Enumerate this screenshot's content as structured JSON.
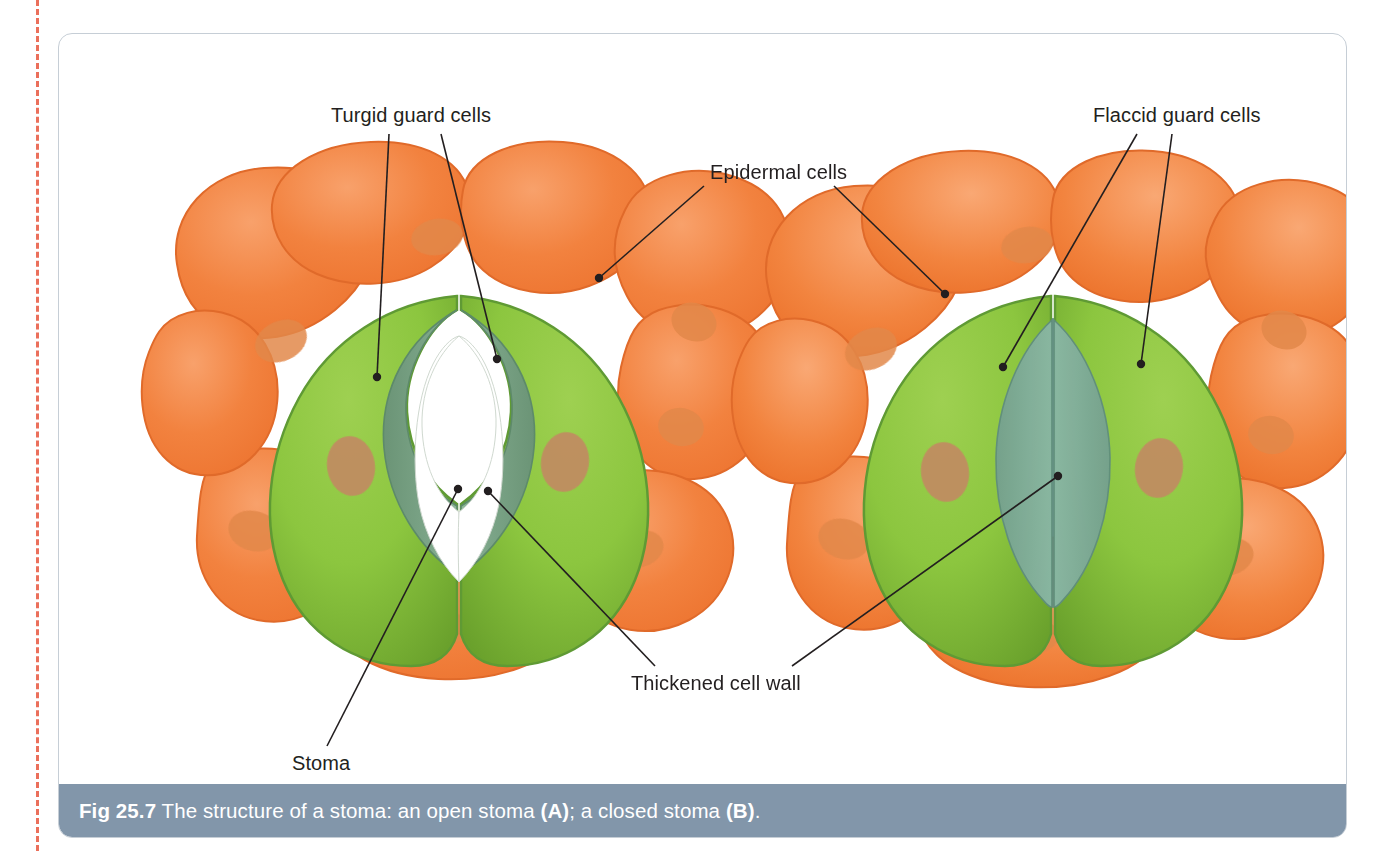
{
  "figure": {
    "caption_prefix": "Fig 25.7",
    "caption_body": " The structure of a stoma: an open stoma ",
    "caption_a": "(A)",
    "caption_mid": "; a closed stoma ",
    "caption_b": "(B)",
    "caption_end": ".",
    "caption_full": "Fig 25.7 The structure of a stoma: an open stoma (A); a closed stoma (B)."
  },
  "labels": {
    "turgid_guard_cells": "Turgid guard cells",
    "epidermal_cells": "Epidermal cells",
    "flaccid_guard_cells": "Flaccid guard cells",
    "thickened_cell_wall": "Thickened cell wall",
    "stoma": "Stoma"
  },
  "diagrams": [
    {
      "id": "A",
      "name": "open-stoma",
      "state": "open",
      "guard_cell_state": "turgid",
      "pore_visible": true,
      "epidermal_cell_count": 8,
      "guard_cell_count": 2
    },
    {
      "id": "B",
      "name": "closed-stoma",
      "state": "closed",
      "guard_cell_state": "flaccid",
      "pore_visible": false,
      "epidermal_cell_count": 8,
      "guard_cell_count": 2
    }
  ],
  "colors": {
    "epidermal_fill": "#f2823f",
    "epidermal_fill_light": "#f59a5e",
    "epidermal_stroke": "#e06a2a",
    "epidermal_nucleus": "#e08a4a",
    "guard_cell_fill": "#8cc63f",
    "guard_cell_fill_dark": "#6fa72f",
    "guard_cell_stroke": "#5f9a34",
    "guard_nucleus": "#c28a62",
    "thickened_wall_open": "#6e9a78",
    "thickened_wall_closed": "#79a596",
    "pore_white": "#ffffff",
    "caption_bar": "#8296aa",
    "caption_text": "#ffffff",
    "label_text": "#231f20",
    "leader_line": "#231f20",
    "box_border": "#c6ced6",
    "trim_line": "#e8573f"
  },
  "leaders": {
    "turgid_left": {
      "from": [
        330,
        100
      ],
      "to": [
        318,
        343
      ]
    },
    "turgid_right": {
      "from": [
        382,
        100
      ],
      "to": [
        438,
        325
      ]
    },
    "epidermal_left": {
      "from": [
        645,
        152
      ],
      "to": [
        540,
        244
      ]
    },
    "epidermal_right": {
      "from": [
        775,
        152
      ],
      "to": [
        886,
        260
      ]
    },
    "flaccid_left": {
      "from": [
        1078,
        100
      ],
      "to": [
        944,
        333
      ]
    },
    "flaccid_right": {
      "from": [
        1113,
        100
      ],
      "to": [
        1082,
        330
      ]
    },
    "thickened_left": {
      "from": [
        596,
        632
      ],
      "to": [
        429,
        457
      ]
    },
    "thickened_right": {
      "from": [
        733,
        632
      ],
      "to": [
        999,
        442
      ]
    },
    "stoma_line": {
      "from": [
        268,
        712
      ],
      "to": [
        399,
        455
      ]
    }
  }
}
